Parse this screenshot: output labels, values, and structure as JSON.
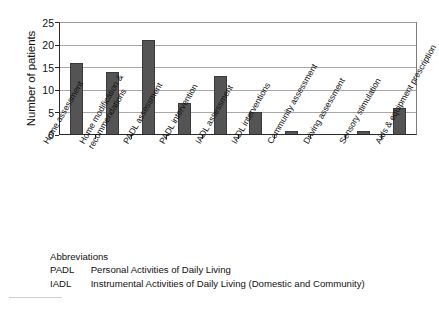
{
  "figure": {
    "y_axis_title": "Number of patients",
    "abbreviations": {
      "heading": "Abbreviations",
      "rows": [
        {
          "key": "PADL",
          "definition": "Personal Activities of Daily Living"
        },
        {
          "key": "IADL",
          "definition": "Instrumental Activities of Daily Living (Domestic and Community)"
        }
      ]
    },
    "colors": {
      "bar_fill": "#545454",
      "bar_edge": "#3a3a3a",
      "gridline": "#a8a8a8",
      "axis": "#2a2a2a",
      "text": "#111111"
    }
  },
  "chart_data": {
    "type": "bar",
    "title": "",
    "xlabel": "",
    "ylabel": "Number of patients",
    "ylim": [
      0,
      25
    ],
    "yticks": [
      0,
      5,
      10,
      15,
      20,
      25
    ],
    "ytick_labels": [
      "0",
      "5",
      "10",
      "15",
      "20",
      "25"
    ],
    "grid": true,
    "grid_axis": "y",
    "legend": false,
    "categories": [
      "Home assessment",
      "Home modification &\nrecommendations",
      "PADL assessment",
      "PADL intervention",
      "IADL assessment",
      "IADL interventions",
      "Community assessment",
      "Driving assessment",
      "Sensory stimulation",
      "Aids & equipment prescription"
    ],
    "category_labels_flat": [
      "Home assessment",
      "Home modification & recommendations",
      "PADL assessment",
      "PADL intervention",
      "IADL assessment",
      "IADL interventions",
      "Community assessment",
      "Driving assessment",
      "Sensory stimulation",
      "Aids & equipment prescription"
    ],
    "values": [
      16,
      14,
      21,
      7,
      13,
      5,
      1,
      0,
      1,
      6
    ]
  }
}
